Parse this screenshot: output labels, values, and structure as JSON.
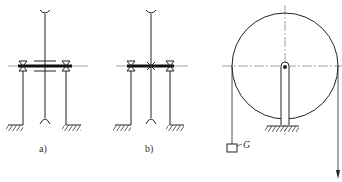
{
  "figure": {
    "panels": [
      {
        "id": "a",
        "label": "a)",
        "description": "Shaft with sleeve/hub on axle between two bearing supports"
      },
      {
        "id": "b",
        "label": "b)",
        "description": "Shaft fixed to axle between two bearing supports"
      },
      {
        "id": "c",
        "label": "",
        "description": "Pulley on support with rope, hanging weight and downward pull"
      }
    ],
    "weight_label": "G",
    "colors": {
      "line": "#222222",
      "centerline": "#555555",
      "background": "#ffffff"
    }
  }
}
